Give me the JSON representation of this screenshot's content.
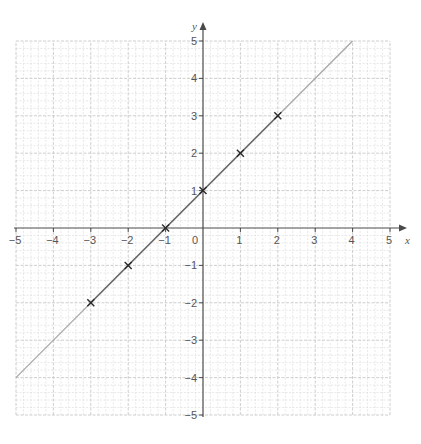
{
  "chart_data": {
    "type": "line",
    "title": "",
    "xlabel": "x",
    "ylabel": "y",
    "xlim": [
      -5,
      5
    ],
    "ylim": [
      -5,
      5
    ],
    "grid": true,
    "minor_grid_per_unit": 5,
    "x_ticks": [
      -5,
      -4,
      -3,
      -2,
      -1,
      0,
      1,
      2,
      3,
      4,
      5
    ],
    "y_ticks": [
      -5,
      -4,
      -3,
      -2,
      -1,
      0,
      1,
      2,
      3,
      4,
      5
    ],
    "x_tick_labels": [
      "−5",
      "−4",
      "−3",
      "−2",
      "−1",
      "0",
      "1",
      "2",
      "3",
      "4",
      "5"
    ],
    "y_tick_labels": [
      "−5",
      "−4",
      "−3",
      "−2",
      "−1",
      "",
      "1",
      "2",
      "3",
      "4",
      "5"
    ],
    "origin_label": "0",
    "series": [
      {
        "name": "y = x + 1",
        "equation": "y = x + 1",
        "line_extent": [
          [
            -5,
            -4
          ],
          [
            4,
            5
          ]
        ],
        "emphasized_extent": [
          [
            -3,
            -2
          ],
          [
            2,
            3
          ]
        ],
        "points": [
          {
            "x": -3,
            "y": -2
          },
          {
            "x": -2,
            "y": -1
          },
          {
            "x": -1,
            "y": 0
          },
          {
            "x": 0,
            "y": 1
          },
          {
            "x": 1,
            "y": 2
          },
          {
            "x": 2,
            "y": 3
          }
        ],
        "marker": "cross"
      }
    ],
    "legend": null
  },
  "colors": {
    "background": "#ffffff",
    "axis": "#4a4a4a",
    "major_grid": "#c8c8c8",
    "minor_grid": "#e2e2e2",
    "line_light": "#a8a8a8",
    "line_dark": "#6a6a6a",
    "marker": "#2a2a2a",
    "text": "#555555"
  },
  "layout": {
    "origin_px": [
      203,
      228
    ],
    "unit_px": 37.4,
    "x_arrow_tip": 407,
    "y_arrow_tip": 22
  }
}
